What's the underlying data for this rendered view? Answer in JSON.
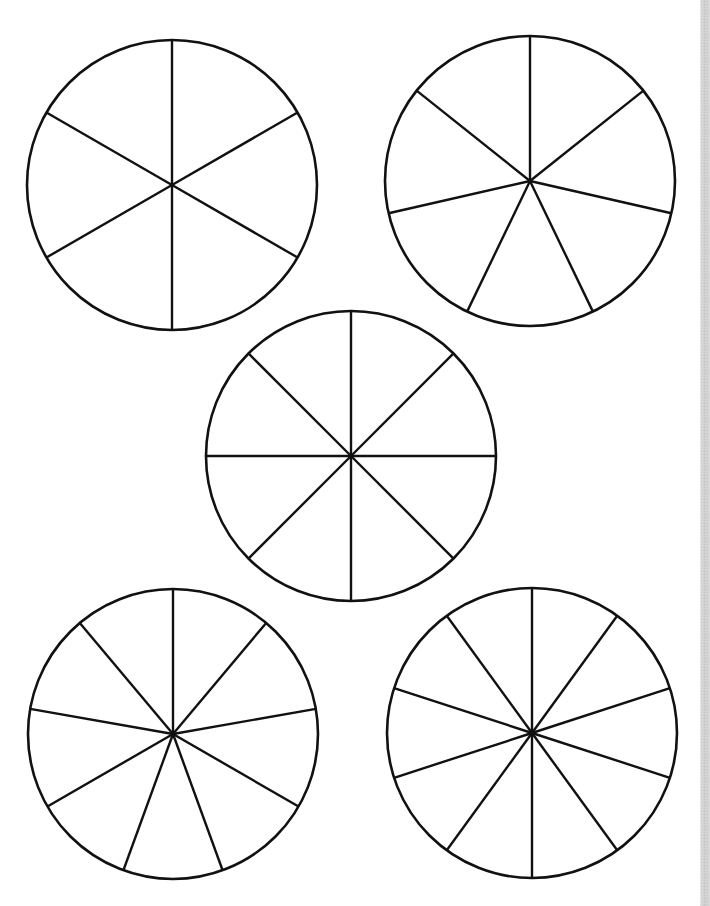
{
  "diagram": {
    "type": "fraction-circles-worksheet",
    "stroke_color": "#111111",
    "background": "#ffffff",
    "circles": [
      {
        "id": "circle-sixths",
        "segments": 6,
        "cx": 172,
        "cy": 185,
        "r": 145,
        "start_angle_deg": 0
      },
      {
        "id": "circle-sevenths",
        "segments": 7,
        "cx": 530,
        "cy": 181,
        "r": 145,
        "start_angle_deg": 0
      },
      {
        "id": "circle-eighths",
        "segments": 8,
        "cx": 351,
        "cy": 456,
        "r": 145,
        "start_angle_deg": 0
      },
      {
        "id": "circle-ninths",
        "segments": 9,
        "cx": 173,
        "cy": 734,
        "r": 145,
        "start_angle_deg": 0
      },
      {
        "id": "circle-tenths",
        "segments": 10,
        "cx": 532,
        "cy": 733,
        "r": 145,
        "start_angle_deg": 0
      }
    ]
  }
}
